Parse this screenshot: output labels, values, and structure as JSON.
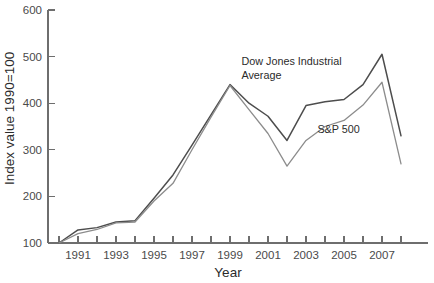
{
  "chart_data": {
    "type": "line",
    "title": "",
    "xlabel": "Year",
    "ylabel": "Index value 1990=100",
    "xlim": [
      1990,
      2008
    ],
    "ylim": [
      100,
      600
    ],
    "ytick_labels": [
      "600",
      "500",
      "400",
      "300",
      "200",
      "100"
    ],
    "yticks": [
      600,
      500,
      400,
      300,
      200,
      100
    ],
    "xtick_labels": [
      "1991",
      "1993",
      "1995",
      "1997",
      "1999",
      "2001",
      "2003",
      "2005",
      "2007"
    ],
    "xticks_labeled": [
      1991,
      1993,
      1995,
      1997,
      1999,
      2001,
      2003,
      2005,
      2007
    ],
    "xticks_all": [
      1990,
      1991,
      1992,
      1993,
      1994,
      1995,
      1996,
      1997,
      1998,
      1999,
      2000,
      2001,
      2002,
      2003,
      2004,
      2005,
      2006,
      2007,
      2008
    ],
    "grid": false,
    "legend_position": "inline-annotation",
    "x": [
      1990,
      1991,
      1992,
      1993,
      1994,
      1995,
      1996,
      1997,
      1998,
      1999,
      2000,
      2001,
      2002,
      2003,
      2004,
      2005,
      2006,
      2007,
      2008
    ],
    "series": [
      {
        "name": "Dow Jones Industrial Average",
        "color": "#4d4d4d",
        "values": [
          100,
          128,
          133,
          145,
          148,
          196,
          246,
          310,
          375,
          440,
          400,
          372,
          320,
          395,
          403,
          408,
          440,
          505,
          330
        ]
      },
      {
        "name": "S&P 500",
        "color": "#8c8c8c",
        "values": [
          100,
          120,
          129,
          143,
          145,
          190,
          228,
          300,
          370,
          438,
          386,
          335,
          265,
          320,
          350,
          363,
          396,
          445,
          270
        ]
      }
    ],
    "annotations": [
      {
        "name": "djia-label",
        "text_line1": "Dow Jones Industrial",
        "text_line2": "Average",
        "x": 1999.6,
        "y": 481
      },
      {
        "name": "sp500-label",
        "text": "S&P 500",
        "x": 2003.6,
        "y": 337
      }
    ]
  }
}
